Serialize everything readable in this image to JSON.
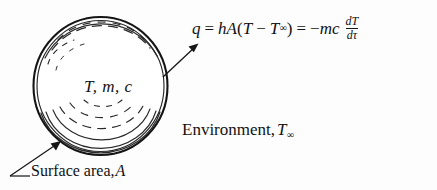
{
  "figure": {
    "background_color": "#fdfdfd",
    "ink_color": "#151515"
  },
  "equation": {
    "heat_rate_symbol": "q",
    "equals_1": "=",
    "convection_coefficient": "h",
    "area_symbol": "A",
    "paren_open": "(",
    "temperature": "T",
    "minus": "−",
    "ambient_temperature": "T",
    "ambient_subscript": "∞",
    "paren_close": ")",
    "equals_2": "=",
    "negative_sign": "−",
    "mass_symbol": "m",
    "specific_heat_symbol": "c",
    "derivative_numerator": "dT",
    "derivative_denominator": "dτ",
    "full_text": "q = hA(T − T∞) = −mc dT/dτ"
  },
  "sphere": {
    "label": "T, m, c",
    "properties": [
      "T",
      "m",
      "c"
    ]
  },
  "environment": {
    "label_text": "Environment,",
    "symbol": "T",
    "subscript": "∞"
  },
  "surface_area": {
    "label_text": "Surface area,",
    "symbol": "A"
  },
  "annotations": {
    "heat_flux_arrow": "arrow-from-sphere-to-equation",
    "surface_area_leader": "leader-line-to-sphere-surface"
  }
}
